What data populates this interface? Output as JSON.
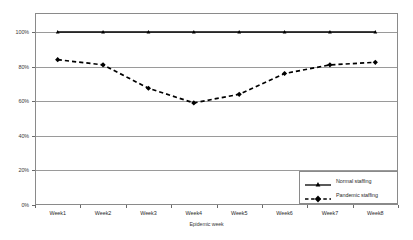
{
  "chart_data": {
    "type": "line",
    "title": "",
    "xlabel": "Epidemic week",
    "ylabel": "",
    "categories": [
      "Week1",
      "Week2",
      "Week3",
      "Week4",
      "Week5",
      "Week6",
      "Week7",
      "Week8"
    ],
    "ylim": [
      0,
      100
    ],
    "yticks": [
      0,
      20,
      40,
      60,
      80,
      100
    ],
    "ytick_labels": [
      "0%",
      "20%",
      "40%",
      "60%",
      "80%",
      "100%"
    ],
    "grid": true,
    "legend_position": "bottom-right",
    "series": [
      {
        "name": "Normal staffing",
        "values": [
          100,
          100,
          100,
          100,
          100,
          100,
          100,
          100
        ],
        "line_style": "solid",
        "marker": "triangle",
        "color": "#000000"
      },
      {
        "name": "Pandemic staffing",
        "values": [
          84,
          81,
          67.5,
          59,
          64,
          76,
          81,
          82.5
        ],
        "line_style": "dashed",
        "marker": "diamond",
        "color": "#000000"
      }
    ]
  },
  "legend": {
    "items": [
      {
        "label": "Normal staffing"
      },
      {
        "label": "Pandemic staffing"
      }
    ]
  },
  "axes": {
    "x_title": "Epidemic week"
  },
  "colors": {
    "series": "#000000",
    "grid": "#9a9a9a",
    "frame": "#8a8a8a",
    "text": "#2b2b2b",
    "background": "#ffffff"
  }
}
